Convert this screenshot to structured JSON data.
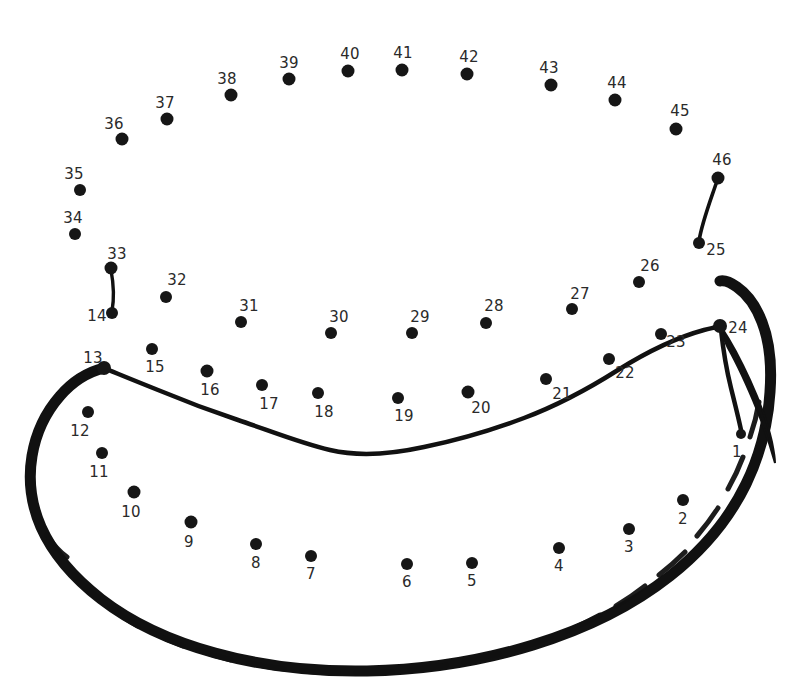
{
  "puzzle": {
    "type": "connect-the-dots",
    "subject": "banana",
    "dot_count": 46,
    "dot_color": "#161616",
    "label_color": "#2a2a2a",
    "line_color": "#111111",
    "background_color": "#ffffff",
    "canvas": {
      "width": 785,
      "height": 690
    }
  },
  "dots": [
    {
      "n": "1",
      "cx": 741,
      "cy": 434,
      "r": 5.0,
      "lx": 737,
      "ly": 452,
      "fs": 15
    },
    {
      "n": "2",
      "cx": 683,
      "cy": 500,
      "r": 6.0,
      "lx": 683,
      "ly": 519,
      "fs": 15
    },
    {
      "n": "3",
      "cx": 629,
      "cy": 529,
      "r": 6.0,
      "lx": 629,
      "ly": 547,
      "fs": 15
    },
    {
      "n": "4",
      "cx": 559,
      "cy": 548,
      "r": 6.0,
      "lx": 559,
      "ly": 566,
      "fs": 15
    },
    {
      "n": "5",
      "cx": 472,
      "cy": 563,
      "r": 6.0,
      "lx": 472,
      "ly": 581,
      "fs": 15
    },
    {
      "n": "6",
      "cx": 407,
      "cy": 564,
      "r": 6.0,
      "lx": 407,
      "ly": 582,
      "fs": 15
    },
    {
      "n": "7",
      "cx": 311,
      "cy": 556,
      "r": 6.0,
      "lx": 311,
      "ly": 574,
      "fs": 15
    },
    {
      "n": "8",
      "cx": 256,
      "cy": 544,
      "r": 6.0,
      "lx": 256,
      "ly": 563,
      "fs": 15
    },
    {
      "n": "9",
      "cx": 191,
      "cy": 522,
      "r": 6.5,
      "lx": 189,
      "ly": 542,
      "fs": 15
    },
    {
      "n": "10",
      "cx": 134,
      "cy": 492,
      "r": 6.5,
      "lx": 131,
      "ly": 512,
      "fs": 15
    },
    {
      "n": "11",
      "cx": 102,
      "cy": 453,
      "r": 6.0,
      "lx": 99,
      "ly": 472,
      "fs": 15
    },
    {
      "n": "12",
      "cx": 88,
      "cy": 412,
      "r": 6.0,
      "lx": 80,
      "ly": 431,
      "fs": 15
    },
    {
      "n": "13",
      "cx": 104,
      "cy": 368,
      "r": 7.0,
      "lx": 93,
      "ly": 358,
      "fs": 15
    },
    {
      "n": "14",
      "cx": 112,
      "cy": 313,
      "r": 6.0,
      "lx": 97,
      "ly": 316,
      "fs": 15
    },
    {
      "n": "15",
      "cx": 152,
      "cy": 349,
      "r": 6.0,
      "lx": 155,
      "ly": 367,
      "fs": 15
    },
    {
      "n": "16",
      "cx": 207,
      "cy": 371,
      "r": 6.5,
      "lx": 210,
      "ly": 390,
      "fs": 15
    },
    {
      "n": "17",
      "cx": 262,
      "cy": 385,
      "r": 6.0,
      "lx": 269,
      "ly": 404,
      "fs": 15
    },
    {
      "n": "18",
      "cx": 318,
      "cy": 393,
      "r": 6.0,
      "lx": 324,
      "ly": 412,
      "fs": 15
    },
    {
      "n": "19",
      "cx": 398,
      "cy": 398,
      "r": 6.0,
      "lx": 404,
      "ly": 416,
      "fs": 15
    },
    {
      "n": "20",
      "cx": 468,
      "cy": 392,
      "r": 6.5,
      "lx": 481,
      "ly": 408,
      "fs": 15
    },
    {
      "n": "21",
      "cx": 546,
      "cy": 379,
      "r": 6.0,
      "lx": 562,
      "ly": 394,
      "fs": 15
    },
    {
      "n": "22",
      "cx": 609,
      "cy": 359,
      "r": 6.0,
      "lx": 625,
      "ly": 373,
      "fs": 15
    },
    {
      "n": "23",
      "cx": 661,
      "cy": 334,
      "r": 6.0,
      "lx": 676,
      "ly": 342,
      "fs": 15
    },
    {
      "n": "24",
      "cx": 720,
      "cy": 326,
      "r": 7.0,
      "lx": 738,
      "ly": 328,
      "fs": 15
    },
    {
      "n": "25",
      "cx": 699,
      "cy": 243,
      "r": 6.0,
      "lx": 716,
      "ly": 250,
      "fs": 15
    },
    {
      "n": "26",
      "cx": 639,
      "cy": 282,
      "r": 6.0,
      "lx": 650,
      "ly": 266,
      "fs": 15
    },
    {
      "n": "27",
      "cx": 572,
      "cy": 309,
      "r": 6.0,
      "lx": 580,
      "ly": 294,
      "fs": 15
    },
    {
      "n": "28",
      "cx": 486,
      "cy": 323,
      "r": 6.0,
      "lx": 494,
      "ly": 306,
      "fs": 15
    },
    {
      "n": "29",
      "cx": 412,
      "cy": 333,
      "r": 6.0,
      "lx": 420,
      "ly": 317,
      "fs": 15
    },
    {
      "n": "30",
      "cx": 331,
      "cy": 333,
      "r": 6.0,
      "lx": 339,
      "ly": 317,
      "fs": 15
    },
    {
      "n": "31",
      "cx": 241,
      "cy": 322,
      "r": 6.0,
      "lx": 249,
      "ly": 306,
      "fs": 15
    },
    {
      "n": "32",
      "cx": 166,
      "cy": 297,
      "r": 6.0,
      "lx": 177,
      "ly": 280,
      "fs": 15
    },
    {
      "n": "33",
      "cx": 111,
      "cy": 268,
      "r": 6.5,
      "lx": 117,
      "ly": 254,
      "fs": 15
    },
    {
      "n": "34",
      "cx": 75,
      "cy": 234,
      "r": 6.0,
      "lx": 73,
      "ly": 218,
      "fs": 15
    },
    {
      "n": "35",
      "cx": 80,
      "cy": 190,
      "r": 6.0,
      "lx": 74,
      "ly": 174,
      "fs": 15
    },
    {
      "n": "36",
      "cx": 122,
      "cy": 139,
      "r": 6.5,
      "lx": 114,
      "ly": 124,
      "fs": 15
    },
    {
      "n": "37",
      "cx": 167,
      "cy": 119,
      "r": 6.5,
      "lx": 165,
      "ly": 103,
      "fs": 15
    },
    {
      "n": "38",
      "cx": 231,
      "cy": 95,
      "r": 6.5,
      "lx": 227,
      "ly": 79,
      "fs": 15
    },
    {
      "n": "39",
      "cx": 289,
      "cy": 79,
      "r": 6.5,
      "lx": 289,
      "ly": 63,
      "fs": 15
    },
    {
      "n": "40",
      "cx": 348,
      "cy": 71,
      "r": 6.5,
      "lx": 350,
      "ly": 54,
      "fs": 15
    },
    {
      "n": "41",
      "cx": 402,
      "cy": 70,
      "r": 6.5,
      "lx": 403,
      "ly": 53,
      "fs": 15
    },
    {
      "n": "42",
      "cx": 467,
      "cy": 74,
      "r": 6.5,
      "lx": 469,
      "ly": 57,
      "fs": 15
    },
    {
      "n": "43",
      "cx": 551,
      "cy": 85,
      "r": 6.5,
      "lx": 549,
      "ly": 68,
      "fs": 15
    },
    {
      "n": "44",
      "cx": 615,
      "cy": 100,
      "r": 6.5,
      "lx": 617,
      "ly": 83,
      "fs": 15
    },
    {
      "n": "45",
      "cx": 676,
      "cy": 129,
      "r": 6.5,
      "lx": 680,
      "ly": 111,
      "fs": 15
    },
    {
      "n": "46",
      "cx": 718,
      "cy": 178,
      "r": 6.5,
      "lx": 722,
      "ly": 160,
      "fs": 15
    }
  ],
  "drawn_segments": [
    {
      "name": "stem-tip-segment-46-25",
      "from": "46",
      "to": "25"
    },
    {
      "name": "short-segment-33-14",
      "from": "33",
      "to": "14"
    },
    {
      "name": "banana-body-outline",
      "from": "13",
      "to": "24"
    },
    {
      "name": "banana-inner-curve",
      "from": "13",
      "to": "24"
    },
    {
      "name": "stem-segment-24-1",
      "from": "24",
      "to": "1"
    }
  ]
}
